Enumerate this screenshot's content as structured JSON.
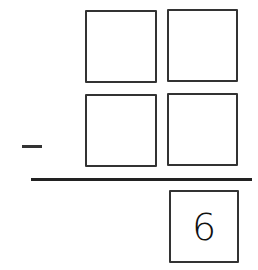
{
  "problem": {
    "operation": "subtraction",
    "operator_symbol": "−",
    "minuend_digits": [
      "",
      ""
    ],
    "subtrahend_digits": [
      "",
      ""
    ],
    "result_digits": [
      "6"
    ]
  }
}
